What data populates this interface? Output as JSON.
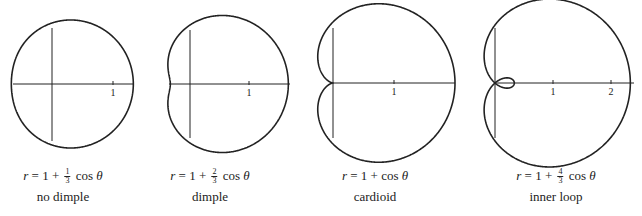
{
  "figure": {
    "width": 642,
    "height": 216,
    "stroke_color": "#222222",
    "plots": [
      {
        "id": "no-dimple",
        "equation": {
          "lhs": "r",
          "const": "1",
          "coef_num": "1",
          "coef_den": "3",
          "trig": "cos",
          "var": "θ"
        },
        "a": 1,
        "b": 0.3333,
        "label": "no dimple",
        "origin": [
          52,
          84
        ],
        "scale": 61,
        "x_axis": [
          13,
          133
        ],
        "y_axis": [
          28,
          141
        ],
        "ticks": [
          {
            "value": 1,
            "label": "1"
          }
        ],
        "caption_x": 63
      },
      {
        "id": "dimple",
        "equation": {
          "lhs": "r",
          "const": "1",
          "coef_num": "2",
          "coef_den": "3",
          "trig": "cos",
          "var": "θ"
        },
        "a": 1,
        "b": 0.6667,
        "label": "dimple",
        "origin": [
          190,
          84
        ],
        "scale": 59,
        "x_axis": [
          169,
          290
        ],
        "y_axis": [
          30,
          138
        ],
        "ticks": [
          {
            "value": 1,
            "label": "1"
          }
        ],
        "caption_x": 210
      },
      {
        "id": "cardioid",
        "equation": {
          "lhs": "r",
          "const": "1",
          "coef_num": "",
          "coef_den": "",
          "trig": "cos",
          "var": "θ"
        },
        "a": 1,
        "b": 1,
        "label": "cardioid",
        "origin": [
          333,
          83
        ],
        "scale": 61,
        "x_axis": [
          333,
          455
        ],
        "y_axis": [
          28,
          138
        ],
        "ticks": [
          {
            "value": 1,
            "label": "1"
          }
        ],
        "caption_x": 375
      },
      {
        "id": "inner-loop",
        "equation": {
          "lhs": "r",
          "const": "1",
          "coef_num": "4",
          "coef_den": "3",
          "trig": "cos",
          "var": "θ"
        },
        "a": 1,
        "b": 1.3333,
        "label": "inner loop",
        "origin": [
          495,
          83
        ],
        "scale": 58,
        "x_axis": [
          495,
          634
        ],
        "y_axis": [
          28,
          138
        ],
        "ticks": [
          {
            "value": 1,
            "label": "1"
          },
          {
            "value": 2,
            "label": "2"
          }
        ],
        "caption_x": 556
      }
    ]
  }
}
